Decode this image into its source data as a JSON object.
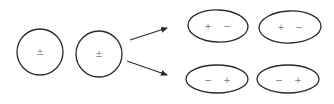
{
  "diagram": {
    "spheres": [
      {
        "id": "sphere-1",
        "label": "±",
        "cx": 40,
        "cy": 52,
        "r": 23
      },
      {
        "id": "sphere-2",
        "label": "±",
        "cx": 99,
        "cy": 54,
        "r": 23
      }
    ],
    "arrows": [
      {
        "id": "arrow-up",
        "x1": 130,
        "y1": 40,
        "x2": 167,
        "y2": 28
      },
      {
        "id": "arrow-down",
        "x1": 127,
        "y1": 61,
        "x2": 167,
        "y2": 75
      }
    ],
    "ellipses": [
      {
        "id": "ellipse-top-left",
        "cx": 218,
        "cy": 26,
        "rx": 30,
        "ry": 16,
        "left_sign": "+",
        "right_sign": "−"
      },
      {
        "id": "ellipse-top-right",
        "cx": 290,
        "cy": 27,
        "rx": 31,
        "ry": 16,
        "left_sign": "+",
        "right_sign": "−"
      },
      {
        "id": "ellipse-bottom-left",
        "cx": 217,
        "cy": 79,
        "rx": 31,
        "ry": 14,
        "left_sign": "−",
        "right_sign": "+"
      },
      {
        "id": "ellipse-bottom-right",
        "cx": 288,
        "cy": 79,
        "rx": 31,
        "ry": 14,
        "left_sign": "−",
        "right_sign": "+"
      }
    ]
  }
}
